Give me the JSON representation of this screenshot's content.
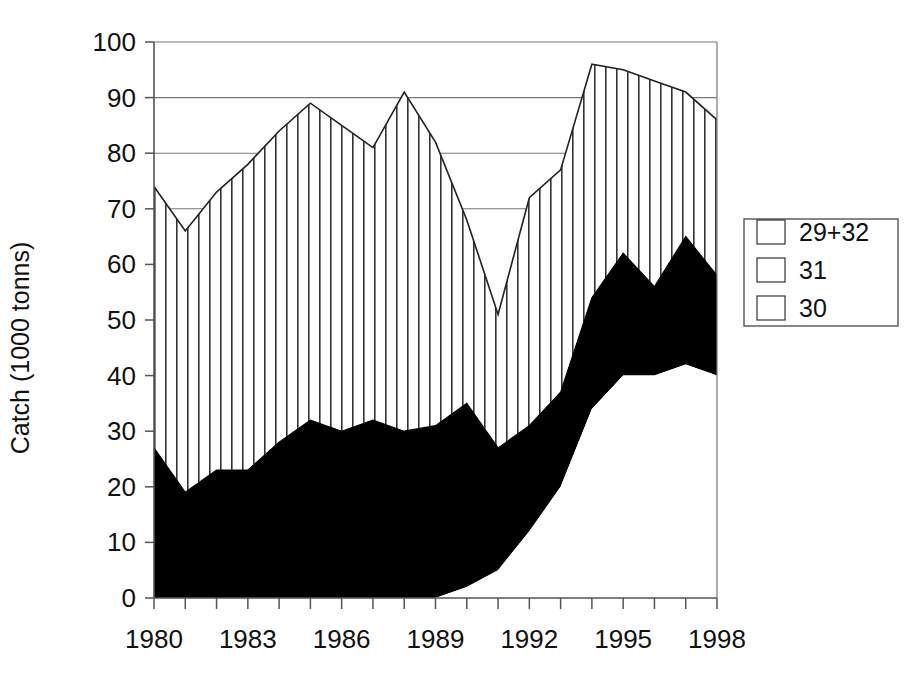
{
  "chart_data": {
    "type": "area",
    "title": "",
    "subtitle": "",
    "xlabel": "",
    "ylabel": "Catch (1000 tonns)",
    "stacked": true,
    "grid": true,
    "gridlines_y": [
      80,
      90,
      70
    ],
    "legend_position": "right",
    "xlim": [
      1980,
      1998
    ],
    "ylim": [
      0,
      100
    ],
    "ytick_values": [
      0,
      10,
      20,
      30,
      40,
      50,
      60,
      70,
      80,
      90,
      100
    ],
    "ytick_labels": [
      "0",
      "10",
      "20",
      "30",
      "40",
      "50",
      "60",
      "70",
      "80",
      "90",
      "100"
    ],
    "xtick_values": [
      1980,
      1981,
      1982,
      1983,
      1984,
      1985,
      1986,
      1987,
      1988,
      1989,
      1990,
      1991,
      1992,
      1993,
      1994,
      1995,
      1996,
      1997,
      1998
    ],
    "xtick_labels_shown": [
      "1980",
      "1983",
      "1986",
      "1989",
      "1992",
      "1995",
      "1998"
    ],
    "xtick_label_values": [
      1980,
      1983,
      1986,
      1989,
      1992,
      1995,
      1998
    ],
    "x": [
      1980,
      1981,
      1982,
      1983,
      1984,
      1985,
      1986,
      1987,
      1988,
      1989,
      1990,
      1991,
      1992,
      1993,
      1994,
      1995,
      1996,
      1997,
      1998
    ],
    "series": [
      {
        "name": "30",
        "fill": "white",
        "values": [
          0,
          0,
          0,
          0,
          0,
          0,
          0,
          0,
          0,
          0,
          2,
          5,
          12,
          20,
          34,
          40,
          40,
          42,
          40
        ]
      },
      {
        "name": "31",
        "fill": "black",
        "values": [
          27,
          19,
          23,
          23,
          28,
          32,
          30,
          32,
          30,
          31,
          35,
          27,
          31,
          37,
          54,
          62,
          56,
          65,
          58
        ]
      },
      {
        "name": "29+32",
        "fill": "vertical-hatch",
        "values": [
          74,
          66,
          73,
          78,
          84,
          89,
          85,
          81,
          91,
          82,
          68,
          51,
          72,
          77,
          96,
          95,
          93,
          91,
          86
        ]
      }
    ],
    "cumulative_top_30": [
      0,
      0,
      0,
      0,
      0,
      0,
      0,
      0,
      0,
      0,
      2,
      5,
      12,
      20,
      34,
      40,
      40,
      42,
      40
    ],
    "cumulative_top_31": [
      27,
      19,
      23,
      23,
      28,
      32,
      30,
      32,
      30,
      31,
      35,
      27,
      31,
      37,
      54,
      62,
      56,
      65,
      58
    ],
    "cumulative_top_total": [
      74,
      66,
      73,
      78,
      84,
      89,
      85,
      81,
      91,
      82,
      68,
      51,
      72,
      77,
      96,
      95,
      93,
      91,
      86
    ]
  },
  "legend": {
    "entries": [
      {
        "label": "29+32",
        "pattern": "vertical-hatch"
      },
      {
        "label": "31",
        "pattern": "solid-black"
      },
      {
        "label": "30",
        "pattern": "empty-white"
      }
    ]
  },
  "axes": {
    "y_title": "Catch (1000 tonns)",
    "y_labels": [
      "100",
      "90",
      "80",
      "70",
      "60",
      "50",
      "40",
      "30",
      "20",
      "10",
      "0"
    ],
    "x_labels": [
      "1980",
      "1983",
      "1986",
      "1989",
      "1992",
      "1995",
      "1998"
    ]
  },
  "colors": {
    "background": "#ffffff",
    "ink": "#111111",
    "axis": "#555555",
    "grid": "#777777",
    "series_31": "#000000",
    "series_30": "#ffffff",
    "hatch": "#333333"
  }
}
